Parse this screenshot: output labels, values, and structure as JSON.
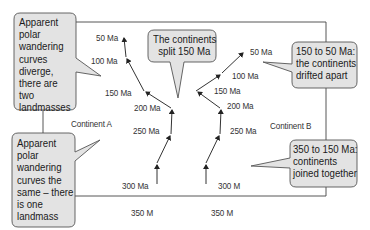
{
  "diagram": {
    "title": "Apparent polar wandering curves",
    "continents": [
      {
        "label": "Continent A"
      },
      {
        "label": "Continent B"
      }
    ],
    "curve_a": {
      "points": [
        {
          "label": "350 M"
        },
        {
          "label": "300 Ma"
        },
        {
          "label": "250 Ma"
        },
        {
          "label": "200 Ma"
        },
        {
          "label": "150 Ma"
        },
        {
          "label": "100 Ma"
        },
        {
          "label": "50 Ma"
        }
      ]
    },
    "curve_b": {
      "points": [
        {
          "label": "350 M"
        },
        {
          "label": "300 M"
        },
        {
          "label": "250 Ma"
        },
        {
          "label": "200 Ma"
        },
        {
          "label": "150 Ma"
        },
        {
          "label": "100 Ma"
        },
        {
          "label": "50 Ma"
        }
      ]
    },
    "callouts": {
      "diverge": [
        "Apparent",
        "polar",
        "wandering",
        "curves",
        "diverge,",
        "there are",
        "two",
        "landmasses"
      ],
      "same": [
        "Apparent",
        "polar",
        "wandering",
        "curves the",
        "same – there",
        "is one",
        "landmass"
      ],
      "split": [
        "The continents",
        "split 150 Ma"
      ],
      "drifted": [
        "150 to 50 Ma:",
        "the continents",
        "drifted apart"
      ],
      "joined": [
        "350 to 150 Ma:",
        "continents",
        "joined together"
      ]
    },
    "colors": {
      "bubble_fill": "#e3e3e3",
      "bubble_stroke": "#555555",
      "line": "#333333",
      "frame": "#444444"
    }
  }
}
